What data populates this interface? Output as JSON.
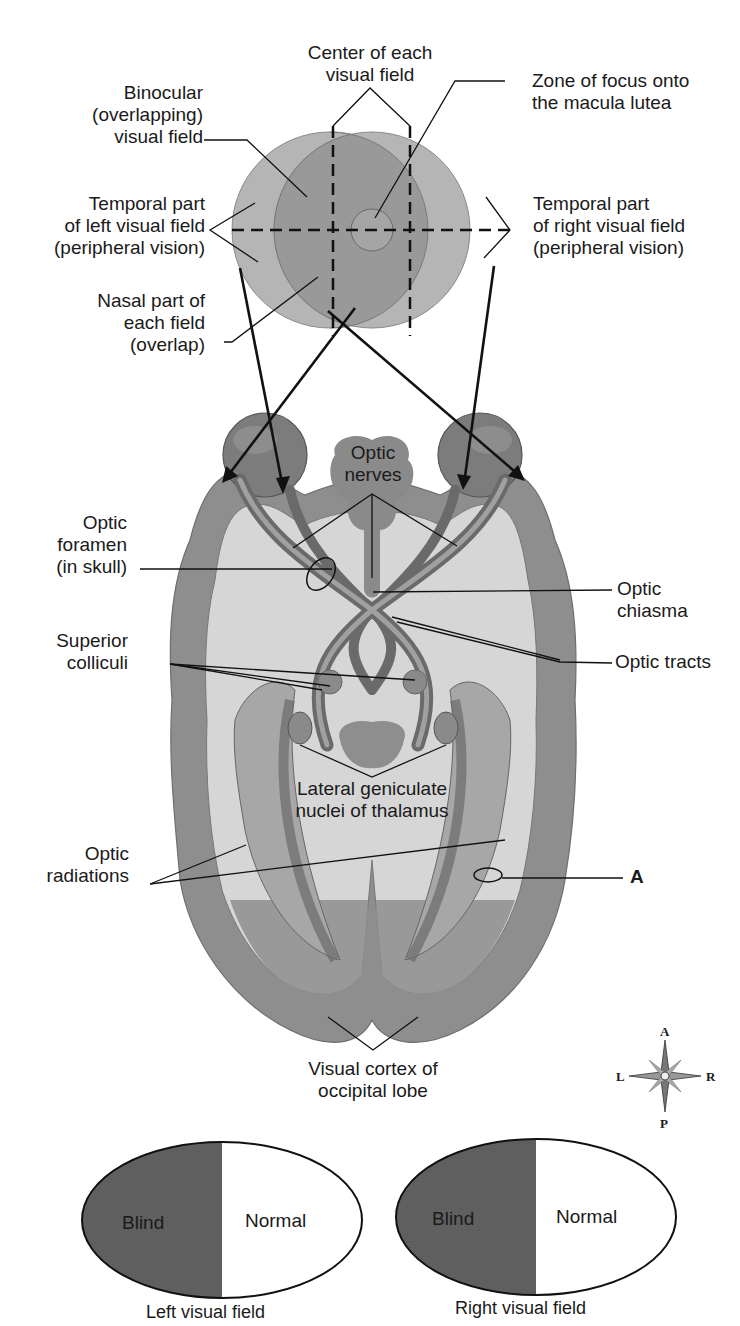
{
  "diagram": {
    "colors": {
      "background": "#ffffff",
      "outer_field": "#b8b8b8",
      "inner_field": "#9a9a9a",
      "cortex": "#8e8e8e",
      "white_matter": "#d9d9d9",
      "eyeball": "#7e7e7e",
      "blind": "#5e5e5e",
      "normal": "#ffffff",
      "line": "#111111"
    }
  },
  "visual_field_labels": {
    "center": [
      "Center of each",
      "visual field"
    ],
    "binocular": [
      "Binocular",
      "(overlapping)",
      "visual field"
    ],
    "macula": [
      "Zone of focus onto",
      "the macula lutea"
    ],
    "temporal_left": [
      "Temporal part",
      "of left visual field",
      "(peripheral vision)"
    ],
    "temporal_right": [
      "Temporal part",
      "of right visual field",
      "(peripheral vision)"
    ],
    "nasal": [
      "Nasal part of",
      "each field",
      "(overlap)"
    ]
  },
  "brain_labels": {
    "optic_nerves": [
      "Optic",
      "nerves"
    ],
    "optic_foramen": [
      "Optic",
      "foramen",
      "(in skull)"
    ],
    "optic_chiasma": [
      "Optic",
      "chiasma"
    ],
    "superior_colliculi": [
      "Superior",
      "colliculi"
    ],
    "optic_tracts": "Optic tracts",
    "lateral_geniculate": [
      "Lateral geniculate",
      "nuclei of thalamus"
    ],
    "optic_radiations": [
      "Optic",
      "radiations"
    ],
    "marker_a": "A",
    "visual_cortex": [
      "Visual cortex of",
      "occipital lobe"
    ]
  },
  "compass": {
    "anterior": "A",
    "posterior": "P",
    "left": "L",
    "right": "R"
  },
  "field_defects": [
    {
      "caption": "Left visual field",
      "left_half": "Blind",
      "right_half": "Normal"
    },
    {
      "caption": "Right visual field",
      "left_half": "Blind",
      "right_half": "Normal"
    }
  ]
}
